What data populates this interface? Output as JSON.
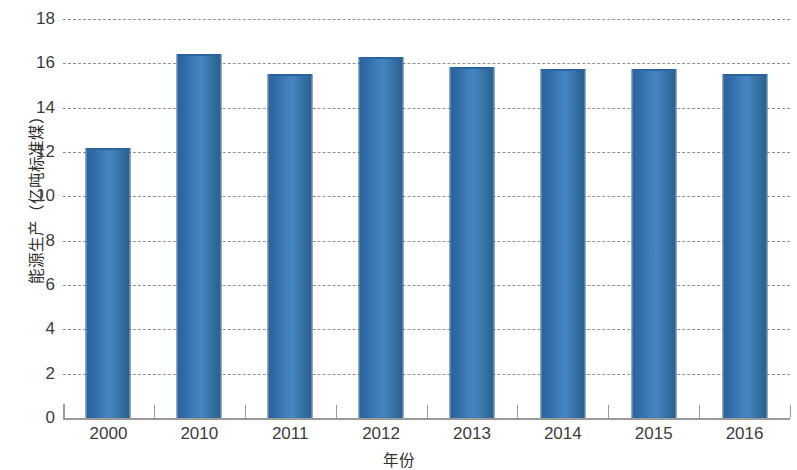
{
  "chart_data": {
    "type": "bar",
    "title": "",
    "xlabel": "年份",
    "ylabel": "能源生产（亿吨标准煤）",
    "categories": [
      "2000",
      "2010",
      "2011",
      "2012",
      "2013",
      "2014",
      "2015",
      "2016"
    ],
    "values": [
      12.2,
      16.4,
      15.5,
      16.3,
      15.85,
      15.75,
      15.75,
      15.5
    ],
    "ylim": [
      0,
      18
    ],
    "ytick_labels": [
      "0",
      "2",
      "4",
      "6",
      "8",
      "10",
      "12",
      "14",
      "16",
      "18"
    ],
    "ytick_values": [
      0,
      2,
      4,
      6,
      8,
      10,
      12,
      14,
      16,
      18
    ],
    "grid": true,
    "grid_style": "dashed",
    "legend": false,
    "series_color": "#3a77b5",
    "series_color_dark": "#2a639f",
    "axis_color": "#9a9a9a",
    "grid_color": "#8d8d8d",
    "background": "#ffffff"
  }
}
